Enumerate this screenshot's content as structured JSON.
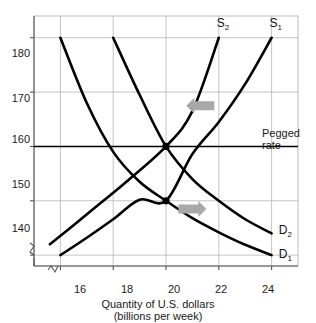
{
  "chart_data": {
    "type": "line",
    "title": "",
    "xlabel": "Quantity of U.S. dollars",
    "xlabel_sub": "(billions per week)",
    "ylabel": "",
    "xlim": [
      15.0,
      25.0
    ],
    "ylim": [
      138.0,
      184.0
    ],
    "xticks": [
      "16",
      "18",
      "20",
      "22",
      "24"
    ],
    "xtick_values": [
      16,
      18,
      20,
      22,
      24
    ],
    "yticks": [
      "180",
      "170",
      "160",
      "150",
      "140"
    ],
    "ytick_values": [
      180,
      170,
      160,
      150,
      140
    ],
    "grid": true,
    "axis_break_x": true,
    "axis_break_y": true,
    "legend": "inline-curve-labels",
    "series": [
      {
        "name": "D₁",
        "label": "D",
        "sub": "1",
        "kind": "demand",
        "points": [
          [
            16,
            180
          ],
          [
            17,
            168
          ],
          [
            18,
            159
          ],
          [
            19,
            153.5
          ],
          [
            20,
            150
          ],
          [
            21,
            146.8
          ],
          [
            22,
            144.2
          ],
          [
            23,
            141.9
          ],
          [
            24,
            140
          ]
        ],
        "label_pos": [
          24.35,
          140
        ]
      },
      {
        "name": "D₂",
        "label": "D",
        "sub": "2",
        "kind": "demand",
        "points": [
          [
            18,
            180
          ],
          [
            19,
            169.5
          ],
          [
            20,
            160
          ],
          [
            21,
            154
          ],
          [
            22,
            150
          ],
          [
            23,
            146.6
          ],
          [
            24,
            144
          ]
        ],
        "label_pos": [
          24.35,
          144.5
        ]
      },
      {
        "name": "S₁",
        "label": "S",
        "sub": "1",
        "kind": "supply",
        "points": [
          [
            16,
            140
          ],
          [
            17,
            143.2
          ],
          [
            18,
            146.6
          ],
          [
            19,
            150.2
          ],
          [
            20,
            150
          ],
          [
            21,
            158.6
          ],
          [
            22,
            164.5
          ],
          [
            23,
            171.5
          ],
          [
            24,
            180
          ]
        ],
        "label_pos": [
          24.0,
          182.5
        ]
      },
      {
        "name": "S₂",
        "label": "S",
        "sub": "2",
        "kind": "supply",
        "points": [
          [
            15.6,
            142
          ],
          [
            16.5,
            145.5
          ],
          [
            17.5,
            149.5
          ],
          [
            18.5,
            153.5
          ],
          [
            20,
            160
          ],
          [
            21,
            166.5
          ],
          [
            22,
            180
          ]
        ],
        "label_pos": [
          22.0,
          182.5
        ]
      }
    ],
    "annotations": [
      {
        "name": "pegged-rate-line",
        "type": "hline",
        "y": 160,
        "text": "Pegged",
        "text2": "rate",
        "color": "#000000"
      },
      {
        "name": "equilibrium-point-upper",
        "type": "point",
        "x": 20,
        "y": 160,
        "color": "#000000"
      },
      {
        "name": "equilibrium-point-lower",
        "type": "point",
        "x": 20,
        "y": 150,
        "color": "#000000"
      },
      {
        "name": "supply-shift-arrow",
        "type": "arrow",
        "direction": "left",
        "x": 21.3,
        "y": 167.5,
        "color": "#a8a8a8"
      },
      {
        "name": "demand-shift-arrow",
        "type": "arrow",
        "direction": "right",
        "x": 21.0,
        "y": 148.5,
        "color": "#a8a8a8"
      }
    ],
    "colors": {
      "curve": "#000000",
      "grid": "#b5b5b5",
      "axis": "#555555",
      "arrow": "#a8a8a8",
      "text": "#1a1a1a"
    }
  },
  "axis": {
    "x_title": "Quantity of U.S. dollars",
    "x_title_sub": "(billions per week)"
  },
  "labels": {
    "pegged_line1": "Pegged",
    "pegged_line2": "rate",
    "y": [
      "180",
      "170",
      "160",
      "150",
      "140"
    ],
    "x": [
      "16",
      "18",
      "20",
      "22",
      "24"
    ]
  }
}
